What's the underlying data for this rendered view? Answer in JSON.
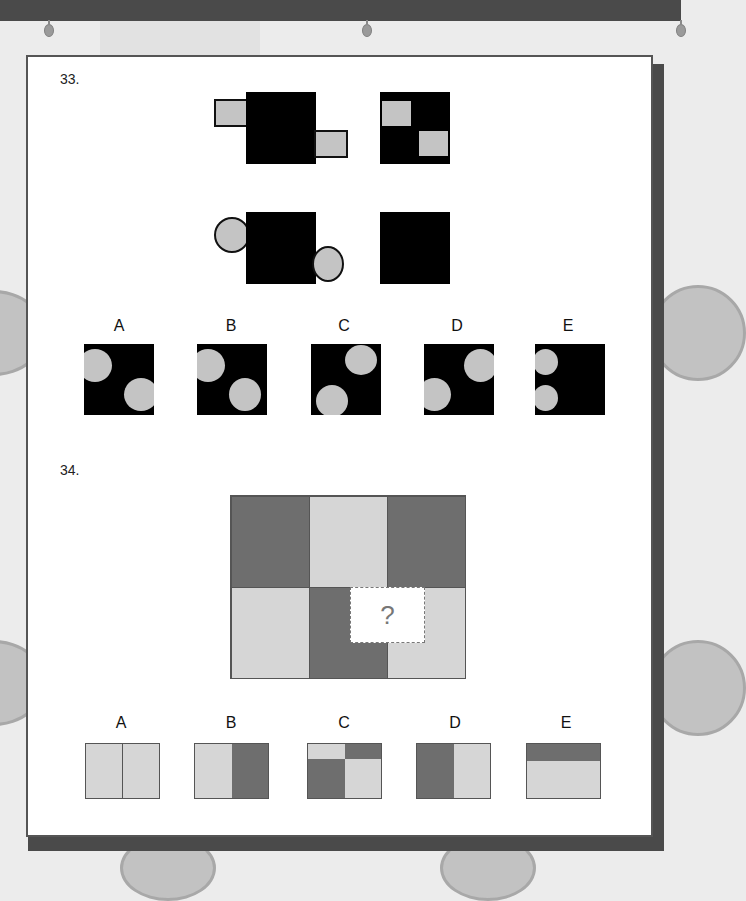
{
  "document": {
    "questions": [
      {
        "number": "33.",
        "type": "analogy",
        "stimulus_row1": {
          "left": "black square with two light-grey rectangles protruding top-left and bottom-right",
          "right": "black square with two light-grey squares inside top-left and bottom-right"
        },
        "stimulus_row2": {
          "left": "black square with two light-grey circles protruding top-left and bottom-right",
          "right": "black square (answer missing)"
        },
        "options": [
          {
            "label": "A",
            "description": "circles clipped at left and right edges"
          },
          {
            "label": "B",
            "description": "left circle clipped, right circle inside"
          },
          {
            "label": "C",
            "description": "circles top-right and bottom-left"
          },
          {
            "label": "D",
            "description": "circles top-right and bottom-left clipped"
          },
          {
            "label": "E",
            "description": "two circles stacked on left edge"
          }
        ]
      },
      {
        "number": "34.",
        "type": "pattern completion",
        "missing_mark": "?",
        "grid": {
          "top_row": [
            "dark",
            "light",
            "dark"
          ],
          "bottom_row": [
            "light",
            "dark",
            "light"
          ]
        },
        "options": [
          {
            "label": "A",
            "description": "light | light"
          },
          {
            "label": "B",
            "description": "light | dark"
          },
          {
            "label": "C",
            "description": "top: light | dark, bottom: dark | light"
          },
          {
            "label": "D",
            "description": "dark | light"
          },
          {
            "label": "E",
            "description": "dark top band, light bottom"
          }
        ]
      }
    ]
  },
  "colors": {
    "black": "#000000",
    "light_grey": "#c4c4c4",
    "dark_tile": "#6e6e6e",
    "light_tile": "#d6d6d6",
    "border": "#555555",
    "top_bar": "#4a4a4a"
  }
}
